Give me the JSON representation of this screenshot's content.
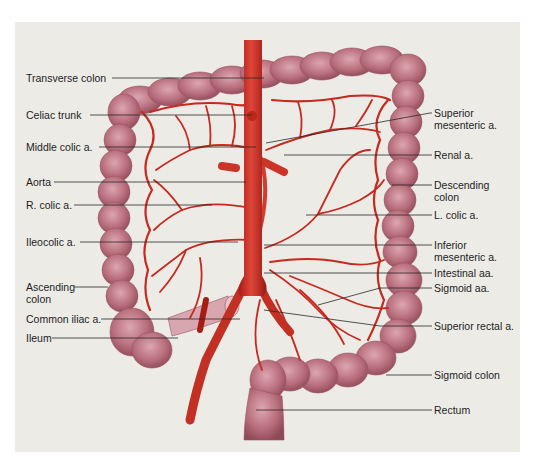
{
  "figure": {
    "colors": {
      "background": "#ecebe6",
      "artery": "#c8281e",
      "artery_dark": "#9e1a14",
      "colon": "#b56a78",
      "colon_light": "#d49aa4",
      "leader_line": "#2a2a2a",
      "text": "#1e1e1e"
    }
  },
  "labels_left": [
    {
      "id": "transverse-colon",
      "text": "Transverse colon"
    },
    {
      "id": "celiac-trunk",
      "text": "Celiac trunk"
    },
    {
      "id": "middle-colic-a",
      "text": "Middle colic a."
    },
    {
      "id": "aorta",
      "text": "Aorta"
    },
    {
      "id": "r-colic-a",
      "text": "R. colic a."
    },
    {
      "id": "ileocolic-a",
      "text": "Ileocolic a."
    },
    {
      "id": "ascending-colon",
      "line1": "Ascending",
      "line2": "colon"
    },
    {
      "id": "common-iliac-a",
      "text": "Common iliac a."
    },
    {
      "id": "ileum",
      "text": "Ileum"
    }
  ],
  "labels_right": [
    {
      "id": "superior-mesenteric-a",
      "line1": "Superior",
      "line2": "mesenteric a."
    },
    {
      "id": "renal-a",
      "text": "Renal a."
    },
    {
      "id": "descending-colon",
      "line1": "Descending",
      "line2": "colon"
    },
    {
      "id": "l-colic-a",
      "text": "L. colic a."
    },
    {
      "id": "inferior-mesenteric-a",
      "line1": "Inferior",
      "line2": "mesenteric a."
    },
    {
      "id": "intestinal-aa",
      "text": "Intestinal aa."
    },
    {
      "id": "sigmoid-aa",
      "text": "Sigmoid aa."
    },
    {
      "id": "superior-rectal-a",
      "text": "Superior rectal a."
    },
    {
      "id": "sigmoid-colon",
      "text": "Sigmoid colon"
    },
    {
      "id": "rectum",
      "text": "Rectum"
    }
  ]
}
